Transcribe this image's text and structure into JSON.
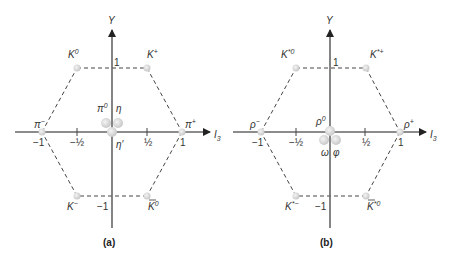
{
  "colors": {
    "axis": "#555555",
    "dashed": "#444444",
    "dot": "#d0d0d0",
    "label": "#333333"
  },
  "diagrams": [
    {
      "caption": "(a)",
      "y_axis_label": "Y",
      "x_axis_label": "I",
      "x_axis_sub": "3",
      "y_tick_top": "1",
      "y_tick_bottom": "−1",
      "x_ticks": [
        "−1",
        "−½",
        "½",
        "1"
      ],
      "particles": [
        {
          "name": "K",
          "sup": "0",
          "bar": false,
          "I3": -0.5,
          "Y": 1
        },
        {
          "name": "K",
          "sup": "+",
          "bar": false,
          "I3": 0.5,
          "Y": 1
        },
        {
          "name": "π",
          "sup": "−",
          "bar": false,
          "I3": -1,
          "Y": 0
        },
        {
          "name": "π",
          "sup": "+",
          "bar": false,
          "I3": 1,
          "Y": 0
        },
        {
          "name": "π",
          "sup": "0",
          "bar": false,
          "I3": 0,
          "Y": 0
        },
        {
          "name": "η",
          "sup": "",
          "bar": false,
          "I3": 0,
          "Y": 0
        },
        {
          "name": "η′",
          "sup": "",
          "bar": false,
          "I3": 0,
          "Y": 0
        },
        {
          "name": "K",
          "sup": "−",
          "bar": false,
          "I3": -0.5,
          "Y": -1
        },
        {
          "name": "K",
          "sup": "0",
          "bar": true,
          "I3": 0.5,
          "Y": -1
        }
      ]
    },
    {
      "caption": "(b)",
      "y_axis_label": "Y",
      "x_axis_label": "I",
      "x_axis_sub": "3",
      "y_tick_top": "1",
      "y_tick_bottom": "−1",
      "x_ticks": [
        "−1",
        "−½",
        "½",
        "1"
      ],
      "particles": [
        {
          "name": "K",
          "sup": "*0",
          "bar": false,
          "I3": -0.5,
          "Y": 1
        },
        {
          "name": "K",
          "sup": "*+",
          "bar": false,
          "I3": 0.5,
          "Y": 1
        },
        {
          "name": "ρ",
          "sup": "−",
          "bar": false,
          "I3": -1,
          "Y": 0
        },
        {
          "name": "ρ",
          "sup": "+",
          "bar": false,
          "I3": 1,
          "Y": 0
        },
        {
          "name": "ρ",
          "sup": "0",
          "bar": false,
          "I3": 0,
          "Y": 0
        },
        {
          "name": "ω",
          "sup": "",
          "bar": false,
          "I3": 0,
          "Y": 0
        },
        {
          "name": "φ",
          "sup": "",
          "bar": false,
          "I3": 0,
          "Y": 0
        },
        {
          "name": "K",
          "sup": "*−",
          "bar": false,
          "I3": -0.5,
          "Y": -1
        },
        {
          "name": "K",
          "sup": "*0",
          "bar": true,
          "I3": 0.5,
          "Y": -1
        }
      ]
    }
  ]
}
